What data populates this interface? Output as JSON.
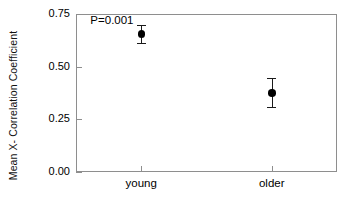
{
  "chart_data": {
    "type": "scatter",
    "title": "",
    "xlabel": "",
    "ylabel": "Mean X- Correlation Coefficient",
    "categories": [
      "young",
      "older"
    ],
    "values": [
      0.655,
      0.375
    ],
    "error_low": [
      0.61,
      0.31
    ],
    "error_high": [
      0.7,
      0.445
    ],
    "ylim": [
      0.0,
      0.75
    ],
    "yticks": [
      "0.00",
      "0.25",
      "0.50",
      "0.75"
    ],
    "ytick_values": [
      0.0,
      0.25,
      0.5,
      0.75
    ],
    "grid": false,
    "legend": "none",
    "annotations": [
      {
        "text": "P=0.001",
        "x_frac": 0.055,
        "y_value": 0.715
      }
    ],
    "series": [
      {
        "name": "Mean X- Correlation Coefficient",
        "points": [
          {
            "category": "young",
            "value": 0.655,
            "low": 0.61,
            "high": 0.7
          },
          {
            "category": "older",
            "value": 0.375,
            "low": 0.31,
            "high": 0.445
          }
        ]
      }
    ],
    "style": {
      "marker": "filled-circle",
      "marker_color": "#000000",
      "errorbar_color": "#1a1a1a",
      "axis_color": "#8e8e8e",
      "background": "#ffffff"
    }
  },
  "axis": {
    "y_title": "Mean X- Correlation Coefficient",
    "y_tick_labels": [
      "0.75",
      "0.50",
      "0.25",
      "0.00"
    ],
    "x_tick_labels": [
      "young",
      "older"
    ]
  },
  "annotation": {
    "p_value": "P=0.001"
  }
}
